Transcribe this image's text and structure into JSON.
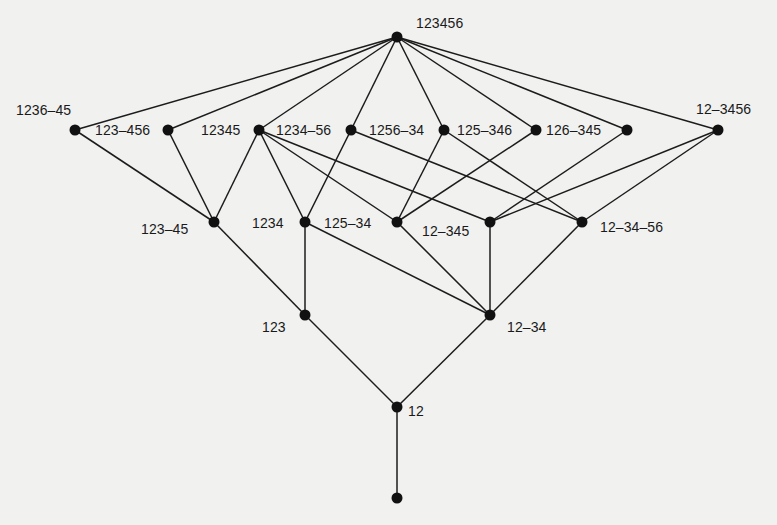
{
  "diagram": {
    "type": "hasse-diagram",
    "nodes": [
      {
        "id": "n123456",
        "label": "123456",
        "x": 397,
        "y": 37,
        "lx": 416,
        "ly": 16
      },
      {
        "id": "n1236_45",
        "label": "1236–45",
        "x": 75,
        "y": 130,
        "lx": 16,
        "ly": 103
      },
      {
        "id": "n123_456",
        "label": "123–456",
        "x": 168,
        "y": 130,
        "lx": 95,
        "ly": 123
      },
      {
        "id": "n12345",
        "label": "12345",
        "x": 259,
        "y": 130,
        "lx": 201,
        "ly": 123
      },
      {
        "id": "n1234_56",
        "label": "1234–56",
        "x": 351,
        "y": 130,
        "lx": 276,
        "ly": 123
      },
      {
        "id": "n1256_34",
        "label": "1256–34",
        "x": 444,
        "y": 130,
        "lx": 369,
        "ly": 123
      },
      {
        "id": "n125_346",
        "label": "125–346",
        "x": 536,
        "y": 130,
        "lx": 457,
        "ly": 123
      },
      {
        "id": "n126_345",
        "label": "126–345",
        "x": 627,
        "y": 130,
        "lx": 546,
        "ly": 123
      },
      {
        "id": "n12_3456",
        "label": "12–3456",
        "x": 718,
        "y": 130,
        "lx": 696,
        "ly": 102
      },
      {
        "id": "n123_45",
        "label": "123–45",
        "x": 214,
        "y": 222,
        "lx": 141,
        "ly": 222
      },
      {
        "id": "n1234",
        "label": "1234",
        "x": 305,
        "y": 222,
        "lx": 252,
        "ly": 216
      },
      {
        "id": "n125_34",
        "label": "125–34",
        "x": 397,
        "y": 222,
        "lx": 324,
        "ly": 216
      },
      {
        "id": "n12_345",
        "label": "12–345",
        "x": 490,
        "y": 222,
        "lx": 422,
        "ly": 224
      },
      {
        "id": "n12_34_56",
        "label": "12–34–56",
        "x": 582,
        "y": 222,
        "lx": 600,
        "ly": 220
      },
      {
        "id": "n123",
        "label": "123",
        "x": 305,
        "y": 315,
        "lx": 262,
        "ly": 320
      },
      {
        "id": "n12_34",
        "label": "12–34",
        "x": 490,
        "y": 315,
        "lx": 507,
        "ly": 320
      },
      {
        "id": "n12",
        "label": "12",
        "x": 397,
        "y": 407,
        "lx": 408,
        "ly": 404
      },
      {
        "id": "n_bottom",
        "label": "",
        "x": 397,
        "y": 498,
        "lx": 0,
        "ly": 0
      }
    ],
    "edges": [
      [
        "n123456",
        "n1236_45"
      ],
      [
        "n123456",
        "n123_456"
      ],
      [
        "n123456",
        "n12345"
      ],
      [
        "n123456",
        "n1234_56"
      ],
      [
        "n123456",
        "n1256_34"
      ],
      [
        "n123456",
        "n125_346"
      ],
      [
        "n123456",
        "n126_345"
      ],
      [
        "n123456",
        "n12_3456"
      ],
      [
        "n1236_45",
        "n123_45"
      ],
      [
        "n123_456",
        "n123_45"
      ],
      [
        "n12345",
        "n123_45"
      ],
      [
        "n12345",
        "n1234"
      ],
      [
        "n12345",
        "n125_34"
      ],
      [
        "n12345",
        "n12_345"
      ],
      [
        "n1234_56",
        "n1234"
      ],
      [
        "n1234_56",
        "n12_34_56"
      ],
      [
        "n1256_34",
        "n125_34"
      ],
      [
        "n1256_34",
        "n12_34_56"
      ],
      [
        "n125_346",
        "n125_34"
      ],
      [
        "n126_345",
        "n12_345"
      ],
      [
        "n12_3456",
        "n12_345"
      ],
      [
        "n12_3456",
        "n12_34_56"
      ],
      [
        "n123_45",
        "n123"
      ],
      [
        "n1234",
        "n123"
      ],
      [
        "n1234",
        "n12_34"
      ],
      [
        "n125_34",
        "n12_34"
      ],
      [
        "n12_345",
        "n12_34"
      ],
      [
        "n12_34_56",
        "n12_34"
      ],
      [
        "n123",
        "n12"
      ],
      [
        "n12_34",
        "n12"
      ],
      [
        "n12",
        "n_bottom"
      ]
    ]
  },
  "labels": {
    "n123456": "123456",
    "n1236_45": "1236–45",
    "n123_456": "123–456",
    "n12345": "12345",
    "n1234_56": "1234–56",
    "n1256_34": "1256–34",
    "n125_346": "125–346",
    "n126_345": "126–345",
    "n12_3456": "12–3456",
    "n123_45": "123–45",
    "n1234": "1234",
    "n125_34": "125–34",
    "n12_345": "12–345",
    "n12_34_56": "12–34–56",
    "n123": "123",
    "n12_34": "12–34",
    "n12": "12"
  },
  "colors": {
    "background": "#f1f1f0",
    "ink": "#111111"
  }
}
